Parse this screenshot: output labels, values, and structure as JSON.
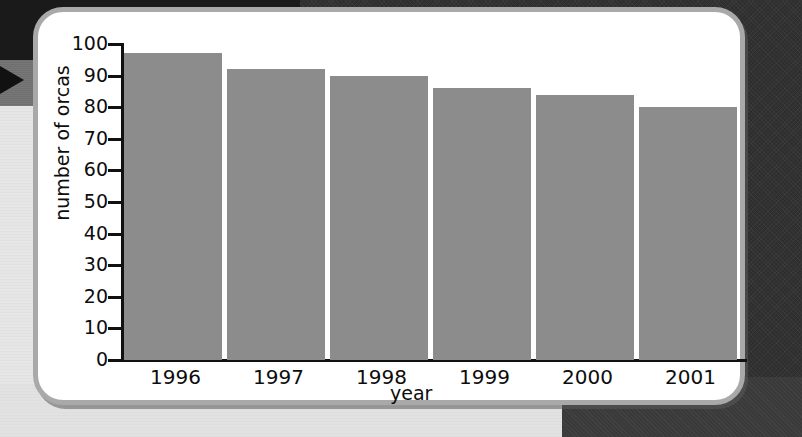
{
  "chart_data": {
    "type": "bar",
    "title": "",
    "xlabel": "year",
    "ylabel": "number of orcas",
    "categories": [
      "1996",
      "1997",
      "1998",
      "1999",
      "2000",
      "2001"
    ],
    "values": [
      97,
      92,
      90,
      86,
      84,
      80
    ],
    "ylim": [
      0,
      100
    ],
    "ytick_labels": [
      "100",
      "90",
      "80",
      "70",
      "60",
      "50",
      "40",
      "30",
      "20",
      "10",
      "0"
    ],
    "ytick_values": [
      100,
      90,
      80,
      70,
      60,
      50,
      40,
      30,
      20,
      10,
      0
    ],
    "grid": false,
    "legend": null,
    "bar_color": "#8c8c8c",
    "axis_color": "#111111",
    "background_color": "#ffffff"
  },
  "page": {
    "card_border_color": "#a9a9a9",
    "marker_arrow_color": "#111111",
    "marker_arrow_name": "page-marker-arrow"
  }
}
